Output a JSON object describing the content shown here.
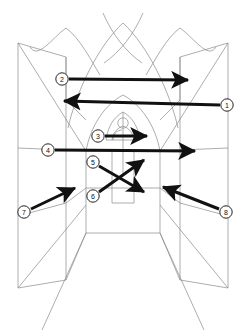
{
  "figure": {
    "type": "line-drawing",
    "width": 246,
    "height": 336,
    "background_color": "#ffffff",
    "line_color": "#8a8a8a",
    "arrow_color": "#111111",
    "callout_fill": "#ffffff",
    "callout_stroke": "#222222"
  },
  "callouts": [
    {
      "id": "1",
      "label": "1",
      "cx": 227,
      "cy": 105,
      "r": 6.5,
      "arrow": {
        "x1": 220.5,
        "y1": 105,
        "x2": 62,
        "y2": 101,
        "direction": "left",
        "style": "thick"
      }
    },
    {
      "id": "2",
      "label": "2",
      "cx": 62,
      "cy": 79,
      "r": 6.5,
      "arrow": {
        "x1": 68.5,
        "y1": 79,
        "x2": 189,
        "y2": 80,
        "direction": "right",
        "style": "thick"
      }
    },
    {
      "id": "3",
      "label": "3",
      "cx": 98,
      "cy": 136,
      "r": 6.5,
      "arrow": {
        "x1": 104.5,
        "y1": 136,
        "x2": 148,
        "y2": 136,
        "direction": "right",
        "style": "thick"
      }
    },
    {
      "id": "4",
      "label": "4",
      "cx": 48,
      "cy": 150,
      "r": 6.5,
      "arrow": {
        "x1": 54.5,
        "y1": 150,
        "x2": 196,
        "y2": 151,
        "direction": "right",
        "style": "thick"
      }
    },
    {
      "id": "5",
      "label": "5",
      "cx": 93,
      "cy": 162,
      "r": 6.5,
      "arrow": {
        "x1": 98.5,
        "y1": 165,
        "x2": 145,
        "y2": 159,
        "direction": "down-right",
        "style": "thick-diagonal"
      }
    },
    {
      "id": "6",
      "label": "6",
      "cx": 93,
      "cy": 196,
      "r": 6.5,
      "arrow": {
        "x1": 98.5,
        "y1": 193,
        "x2": 143,
        "y2": 193,
        "direction": "up-right",
        "style": "thick-diagonal"
      }
    },
    {
      "id": "7",
      "label": "7",
      "cx": 24,
      "cy": 212,
      "r": 6.5,
      "arrow": {
        "x1": 30,
        "y1": 209,
        "x2": 76,
        "y2": 188,
        "direction": "up-right",
        "style": "thick-diagonal"
      }
    },
    {
      "id": "8",
      "label": "8",
      "cx": 226,
      "cy": 212,
      "r": 6.5,
      "arrow": {
        "x1": 220,
        "y1": 209,
        "x2": 162,
        "y2": 187,
        "direction": "up-left",
        "style": "thick-diagonal"
      }
    }
  ],
  "scene": {
    "elements": [
      "vault-ribs-crossing",
      "left-pointed-arch",
      "center-pointed-arch",
      "right-pointed-arch",
      "left-wall-panels",
      "right-wall-panels",
      "nave-floor-perspective",
      "altar-window-tracery",
      "rose-oculus",
      "trefoil-arches"
    ],
    "vanishing_point": {
      "x": 123,
      "y": 150
    }
  }
}
